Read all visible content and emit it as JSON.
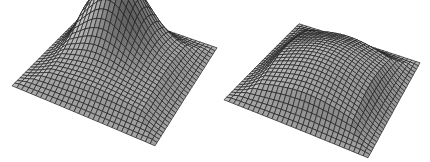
{
  "figure": {
    "width": 430,
    "height": 162,
    "background": "#ffffff",
    "mesh_color": "#1e1e1e",
    "grid_lines": 31
  },
  "surfaces": [
    {
      "id": "surface-left",
      "label": "sharp peak surface",
      "corners": {
        "back": [
          92,
          6
        ],
        "right": [
          217,
          48
        ],
        "front": [
          155,
          146
        ],
        "left": [
          12,
          86
        ]
      },
      "peak": {
        "u": 0.38,
        "v": 0.3,
        "height": 58,
        "width": 0.17
      },
      "dome": {
        "height": 18,
        "width": 0.42
      }
    },
    {
      "id": "surface-right",
      "label": "broad dome surface",
      "corners": {
        "back": [
          299,
          24
        ],
        "right": [
          420,
          63
        ],
        "front": [
          368,
          158
        ],
        "left": [
          224,
          100
        ]
      },
      "peak": {
        "u": 0.4,
        "v": 0.38,
        "height": 0,
        "width": 0.2
      },
      "dome": {
        "height": 34,
        "width": 0.34
      }
    }
  ]
}
